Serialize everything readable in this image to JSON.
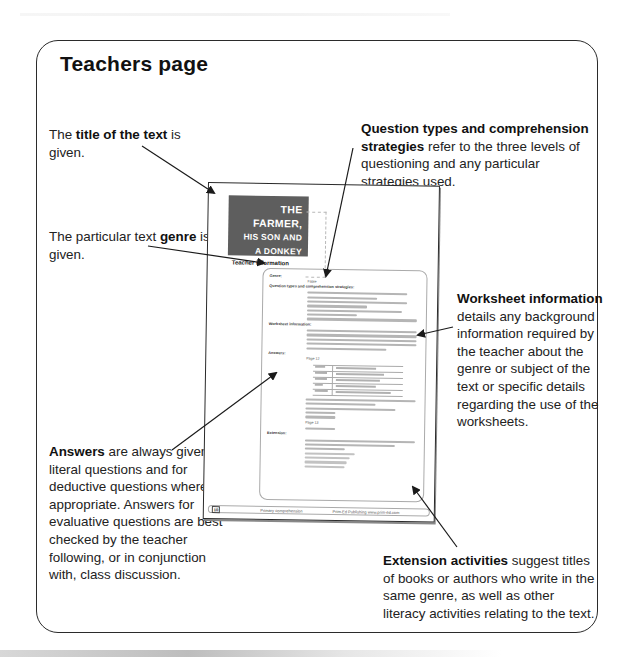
{
  "page": {
    "title": "Teachers page"
  },
  "annotations": {
    "title_of_text": {
      "pre": "The ",
      "bold": "title of the text",
      "post": " is given."
    },
    "genre": {
      "pre": "The particular text ",
      "bold": "genre",
      "post": " is given."
    },
    "question_types": {
      "bold": "Question types and comprehension strategies",
      "post": " refer to the three levels of questioning and any particular strategies used."
    },
    "worksheet_information": {
      "bold": "Worksheet information",
      "post": " details any background information required by the teacher about the genre or subject of the text or specific details regarding the use of the worksheets."
    },
    "answers": {
      "bold": "Answers",
      "post": " are always given for literal questions and for deductive questions where appropriate. Answers for evaluative questions are best checked by the teacher following, or in conjunction with, class discussion."
    },
    "extension_activities": {
      "bold": "Extension activities",
      "post": " suggest titles of books or authors who write in the same genre, as well as other literacy activities relating to the text."
    }
  },
  "thumbnail": {
    "banner": {
      "line1": "The farmer,",
      "line2": "his son and",
      "line3": "a donkey"
    },
    "section_label": "Teacher information",
    "headings": {
      "genre": "Genre:",
      "genre_value": "Fable",
      "question_types": "Question types and comprehension strategies:",
      "worksheet_info": "Worksheet information:",
      "answers": "Answers:",
      "page_ref_1": "Page 12",
      "page_ref_2": "Page 13",
      "extension": "Extension:"
    },
    "answer_table": {
      "rows": [
        [
          "Who?",
          "What did they demand?"
        ],
        [
          "Woman",
          "Someone to ride the donkey"
        ],
        [
          "Old man",
          "Father to ride the donkey"
        ],
        [
          "Girls",
          "Son to ride the donkey"
        ],
        [
          "Squires",
          "No one should ride the donkey"
        ]
      ]
    },
    "extension_titles": [
      "The grasshopper and the ant",
      "The hare and the tortoise",
      "The boy who cried wolf",
      "The lion and the mouse"
    ],
    "footer": {
      "page_number": "10",
      "center": "Primary comprehension",
      "right": "Prim-Ed Publishing  www.prim-ed.com"
    }
  },
  "colors": {
    "frame": "#2b2b2b",
    "banner_bg": "#5e5e5e",
    "text": "#1a1a1a"
  }
}
